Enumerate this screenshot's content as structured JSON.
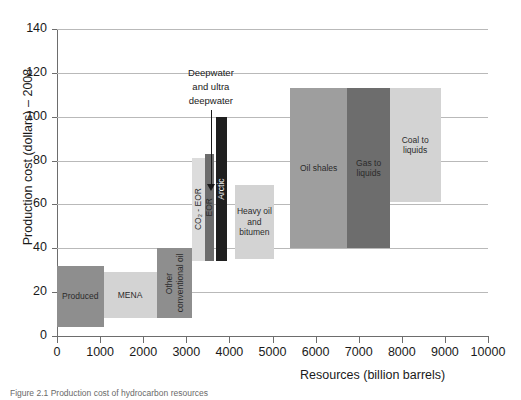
{
  "chart_data": {
    "type": "bar",
    "title": "",
    "xlabel": "Resources (billion barrels)",
    "ylabel": "Production cost (dollars) – 2008",
    "xlim": [
      0,
      10000
    ],
    "ylim": [
      0,
      140
    ],
    "xticks": [
      "0",
      "1000",
      "2000",
      "3000",
      "4000",
      "5000",
      "6000",
      "7000",
      "8000",
      "9000",
      "10000"
    ],
    "yticks": [
      "0",
      "20",
      "40",
      "60",
      "80",
      "100",
      "120",
      "140"
    ],
    "grid": "horizontal",
    "legend": "none",
    "note": "Cost-curve style chart: each box spans a resource range on x and a production-cost range on y",
    "boxes": [
      {
        "label": "Produced",
        "x0": 0,
        "x1": 1080,
        "y0": 4,
        "y1": 32,
        "color": "#8e8e8e"
      },
      {
        "label": "MENA",
        "x0": 1080,
        "x1": 2310,
        "y0": 8,
        "y1": 29,
        "color": "#d3d3d3"
      },
      {
        "label": "Other conventional oil",
        "x0": 2310,
        "x1": 3130,
        "y0": 8,
        "y1": 40,
        "color": "#8e8e8e"
      },
      {
        "label": "CO₂ - EOR",
        "x0": 3130,
        "x1": 3440,
        "y0": 34,
        "y1": 81,
        "color": "#dcdcdc"
      },
      {
        "label": "EOR",
        "x0": 3440,
        "x1": 3640,
        "y0": 34,
        "y1": 83,
        "color": "#6d6d6d"
      },
      {
        "label": "Arctic",
        "x0": 3700,
        "x1": 3950,
        "y0": 34,
        "y1": 100,
        "color": "#1f1f1f"
      },
      {
        "label": "Heavy oil and bitumen",
        "x0": 4130,
        "x1": 5030,
        "y0": 35,
        "y1": 69,
        "color": "#d3d3d3"
      },
      {
        "label": "Oil shales",
        "x0": 5400,
        "x1": 6740,
        "y0": 40,
        "y1": 113,
        "color": "#9e9e9e"
      },
      {
        "label": "Gas to liquids",
        "x0": 6740,
        "x1": 7720,
        "y0": 40,
        "y1": 113,
        "color": "#6d6d6d"
      },
      {
        "label": "Coal to liquids",
        "x0": 7720,
        "x1": 8900,
        "y0": 61,
        "y1": 113,
        "color": "#d3d3d3"
      }
    ],
    "annotations": [
      {
        "text": "Deepwater and ultra deepwater",
        "lines": [
          "Deepwater",
          "and ultra",
          "deepwater"
        ],
        "points_to_x": 3570,
        "points_to_y": 66
      }
    ]
  },
  "caption": {
    "text": "Figure 2.1 Production cost of hydrocarbon resources"
  },
  "colors": {
    "grid": "#b9b9b9",
    "axis": "#6d6d6d",
    "text": "#1a1a1a"
  }
}
